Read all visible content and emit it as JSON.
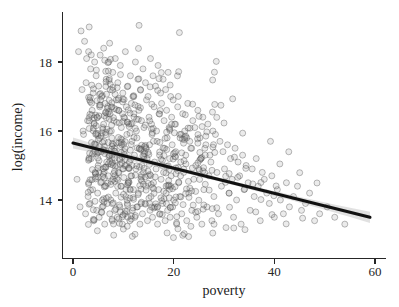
{
  "chart_data": {
    "type": "scatter",
    "title": "",
    "subtitle": "",
    "xlabel": "poverty",
    "ylabel": "log(income)",
    "xlim": [
      -2.5,
      62
    ],
    "ylim": [
      12.9,
      19.1
    ],
    "xticks": [
      0,
      20,
      40,
      60
    ],
    "xticklabels": [
      "0",
      "20",
      "40",
      "60"
    ],
    "yticks": [
      14,
      16,
      18
    ],
    "yticklabels": [
      "14",
      "16",
      "18"
    ],
    "grid": false,
    "legend": null,
    "annotations": [],
    "marker": {
      "shape": "circle",
      "size": 4.2,
      "facecolor": "#808080",
      "facealpha": 0.16,
      "edgecolor": "#4d4d4d",
      "edgealpha": 0.55
    },
    "series": [
      {
        "name": "counties",
        "n_points": 760,
        "x": [
          0.8,
          1.1,
          1.4,
          1.6,
          1.8,
          2.0,
          2.1,
          2.3,
          2.5,
          2.6,
          2.7,
          2.9,
          3.0,
          3.1,
          3.3,
          3.4,
          3.5,
          3.6,
          3.8,
          3.9,
          4.0,
          4.1,
          4.2,
          4.3,
          4.4,
          4.5,
          4.6,
          4.7,
          4.8,
          4.9,
          5.0,
          5.1,
          5.2,
          5.3,
          5.4,
          5.5,
          5.6,
          5.7,
          5.8,
          5.9,
          6.0,
          6.1,
          6.2,
          6.3,
          6.4,
          6.5,
          6.6,
          6.7,
          6.8,
          6.9,
          7.0,
          7.1,
          7.2,
          7.3,
          7.4,
          7.5,
          7.6,
          7.7,
          7.8,
          7.9,
          8.0,
          8.1,
          8.2,
          8.3,
          8.4,
          8.5,
          8.6,
          8.7,
          8.8,
          8.9,
          9.0,
          9.1,
          9.2,
          9.3,
          9.4,
          9.5,
          9.6,
          9.7,
          9.8,
          9.9,
          10.0,
          10.1,
          10.2,
          10.3,
          10.4,
          10.5,
          10.6,
          10.7,
          10.8,
          10.9,
          11.0,
          11.1,
          11.2,
          11.3,
          11.4,
          11.5,
          11.6,
          11.7,
          11.8,
          11.9,
          12.0,
          12.1,
          12.2,
          12.3,
          12.4,
          12.5,
          12.6,
          12.7,
          12.8,
          12.9,
          13.0,
          13.1,
          13.2,
          13.3,
          13.4,
          13.5,
          13.6,
          13.7,
          13.8,
          13.9,
          14.0,
          14.1,
          14.2,
          14.3,
          14.4,
          14.5,
          14.6,
          14.7,
          14.8,
          14.9,
          15.0,
          15.1,
          15.2,
          15.3,
          15.4,
          15.5,
          15.6,
          15.7,
          15.8,
          15.9,
          16.0,
          16.1,
          16.2,
          16.3,
          16.4,
          16.5,
          16.6,
          16.7,
          16.8,
          16.9,
          17.0,
          17.1,
          17.2,
          17.3,
          17.4,
          17.5,
          17.6,
          17.7,
          17.8,
          17.9,
          18.0,
          18.1,
          18.2,
          18.3,
          18.4,
          18.5,
          18.6,
          18.7,
          18.8,
          18.9,
          19.0,
          19.1,
          19.2,
          19.3,
          19.4,
          19.5,
          19.6,
          19.7,
          19.8,
          19.9,
          20.0,
          20.2,
          20.4,
          20.6,
          20.8,
          21.0,
          21.2,
          21.4,
          21.6,
          21.8,
          22.0,
          22.2,
          22.4,
          22.6,
          22.8,
          23.0,
          23.2,
          23.4,
          23.6,
          23.8,
          24.0,
          24.2,
          24.4,
          24.6,
          24.8,
          25.0,
          25.2,
          25.4,
          25.6,
          25.8,
          26.0,
          26.2,
          26.4,
          26.6,
          26.8,
          27.0,
          27.2,
          27.4,
          27.6,
          27.8,
          28.0,
          28.3,
          28.6,
          28.9,
          29.2,
          29.5,
          29.8,
          30.1,
          30.4,
          30.7,
          31.0,
          31.3,
          31.6,
          31.9,
          32.2,
          32.5,
          32.8,
          33.1,
          33.4,
          33.7,
          34.0,
          34.4,
          34.8,
          35.2,
          35.6,
          36.0,
          36.4,
          36.8,
          37.2,
          37.6,
          38.0,
          38.5,
          39.0,
          39.5,
          40.0,
          40.6,
          41.2,
          41.8,
          42.4,
          43.0,
          43.8,
          44.6,
          45.4,
          46.2,
          47.0,
          48.0,
          49.0,
          50.5,
          52.0,
          54.0
        ],
        "y": [
          14.6,
          18.3,
          13.8,
          18.9,
          17.2,
          16.0,
          15.9,
          18.6,
          13.6,
          17.4,
          18.1,
          16.3,
          14.1,
          18.3,
          16.9,
          13.9,
          17.8,
          15.2,
          16.6,
          14.3,
          17.1,
          13.4,
          16.2,
          18.0,
          14.8,
          15.6,
          17.6,
          13.7,
          16.4,
          14.2,
          15.0,
          17.3,
          13.5,
          16.7,
          18.2,
          14.5,
          15.4,
          17.0,
          13.8,
          16.1,
          14.9,
          18.4,
          15.7,
          13.3,
          16.8,
          14.4,
          17.5,
          15.1,
          13.9,
          16.5,
          14.7,
          18.0,
          15.3,
          13.6,
          17.2,
          14.0,
          16.0,
          15.8,
          13.4,
          17.7,
          14.6,
          16.3,
          15.5,
          13.7,
          18.1,
          14.2,
          16.9,
          15.0,
          13.5,
          17.4,
          14.8,
          16.6,
          15.2,
          13.8,
          17.9,
          14.4,
          16.1,
          15.6,
          13.3,
          17.1,
          14.9,
          16.4,
          15.4,
          13.6,
          18.3,
          14.1,
          16.7,
          15.9,
          13.9,
          17.3,
          14.5,
          16.2,
          15.1,
          13.4,
          17.6,
          14.7,
          16.8,
          15.7,
          13.7,
          17.0,
          14.3,
          16.5,
          15.3,
          13.5,
          18.0,
          14.9,
          16.0,
          15.8,
          13.8,
          17.5,
          14.2,
          16.6,
          15.5,
          13.3,
          17.2,
          14.6,
          16.3,
          15.0,
          13.6,
          17.8,
          14.8,
          16.1,
          15.4,
          13.9,
          17.4,
          14.4,
          16.9,
          15.2,
          13.4,
          17.0,
          14.7,
          16.4,
          15.6,
          13.7,
          18.1,
          14.1,
          16.2,
          15.9,
          13.5,
          17.6,
          14.5,
          16.7,
          15.1,
          13.8,
          17.3,
          14.9,
          16.0,
          15.7,
          13.3,
          17.9,
          14.3,
          16.5,
          15.3,
          13.6,
          17.1,
          14.6,
          16.8,
          15.0,
          13.9,
          17.5,
          14.8,
          16.3,
          15.5,
          13.4,
          17.2,
          14.2,
          16.6,
          15.8,
          13.7,
          17.7,
          14.4,
          16.1,
          15.2,
          13.5,
          17.0,
          14.7,
          16.4,
          15.6,
          13.8,
          16.9,
          14.0,
          16.2,
          15.4,
          13.3,
          16.7,
          14.5,
          15.9,
          15.1,
          13.6,
          16.5,
          14.8,
          16.0,
          15.3,
          13.4,
          16.8,
          14.2,
          15.7,
          15.5,
          13.7,
          16.3,
          14.6,
          16.1,
          15.0,
          13.5,
          16.6,
          14.9,
          15.8,
          15.2,
          13.3,
          16.4,
          14.3,
          15.5,
          15.6,
          13.8,
          16.2,
          14.7,
          15.3,
          15.1,
          13.4,
          16.0,
          14.1,
          15.9,
          14.8,
          13.6,
          15.7,
          14.4,
          15.4,
          14.9,
          13.2,
          15.6,
          14.2,
          15.2,
          14.6,
          13.5,
          15.5,
          14.0,
          15.1,
          14.7,
          13.3,
          15.3,
          14.3,
          15.0,
          14.5,
          13.7,
          14.9,
          14.1,
          15.2,
          14.4,
          13.4,
          14.8,
          14.6,
          14.2,
          13.9,
          14.7,
          13.5,
          14.3,
          14.0,
          13.6,
          14.5,
          13.8,
          14.1,
          14.4,
          13.7,
          13.9,
          14.2,
          13.4,
          13.6,
          13.8,
          13.5,
          13.3
        ],
        "description": "Heavy overplotting between poverty 5-30 and log(income) 13.5-16; upper-left cloud extends to log(income) 18.9 near poverty 2; right tail thins out past poverty 45."
      }
    ],
    "fit": {
      "type": "linear-regression",
      "label": "least squares fit with confidence band",
      "intercept": 15.65,
      "slope": -0.0365,
      "x_start": 0.0,
      "y_start": 15.65,
      "x_end": 59.0,
      "y_end": 13.5,
      "line_color": "#111111",
      "line_width": 3.1,
      "band_color": "#9a9a9a",
      "band_opacity": 0.3,
      "band_halfwidth_start": 0.055,
      "band_halfwidth_end": 0.16
    }
  }
}
